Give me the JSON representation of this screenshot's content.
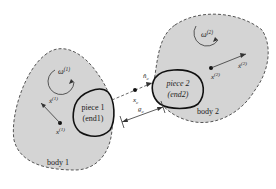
{
  "diagram": {
    "body1": {
      "label": "body 1",
      "omega": "ω",
      "omega_sup": "(1)",
      "x": "x",
      "x_sup": "(1)",
      "xdot": "ẋ",
      "xdot_sup": "(1)"
    },
    "body2": {
      "label": "body 2",
      "omega": "ω",
      "omega_sup": "(2)",
      "x": "x",
      "x_sup": "(2)",
      "xdot": "ẋ",
      "xdot_sup": "(2)"
    },
    "piece1": {
      "line1": "piece 1",
      "line2": "(end1)"
    },
    "piece2": {
      "line1": "piece 2",
      "line2": "(end2)"
    },
    "contact": {
      "normal": "n̂",
      "normal_sub": "c",
      "point": "x",
      "point_sub": "c",
      "gap": "g",
      "gap_sub": "c"
    },
    "colors": {
      "body_fill": "#d4d4d4",
      "outline": "#555555",
      "piece_outline": "#111111"
    }
  }
}
